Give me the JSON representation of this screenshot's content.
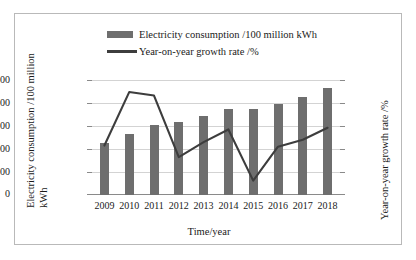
{
  "chart_data": {
    "type": "bar",
    "title": "",
    "categories": [
      "2009",
      "2010",
      "2011",
      "2012",
      "2013",
      "2014",
      "2015",
      "2016",
      "2017",
      "2018"
    ],
    "series": [
      {
        "name": "Electricity consumption /100 million kWh",
        "type": "bar",
        "axis": "left",
        "color": "#6e6e6e",
        "values": [
          1130,
          1320,
          1520,
          1590,
          1710,
          1870,
          1870,
          1980,
          2140,
          2330
        ]
      },
      {
        "name": "Year-on-year growth rate /%",
        "type": "line",
        "axis": "right",
        "color": "#3d3d3d",
        "values": [
          6.6,
          15.9,
          15.3,
          4.6,
          7.2,
          9.4,
          0.5,
          6.4,
          7.6,
          9.7
        ]
      }
    ],
    "xlabel": "Time/year",
    "ylabel": "Electricity consumption /100 million kWh",
    "ylabel_line1": "Electricity consumption /100 million",
    "ylabel_line2": "kWh",
    "y2label": "Year-on-year growth rate /%",
    "ylim": [
      0,
      2500
    ],
    "y2lim": [
      -2,
      18
    ],
    "yticks": [
      "0",
      "500",
      "1000",
      "1500",
      "2000",
      "2500"
    ],
    "ytick_values": [
      0,
      500,
      1000,
      1500,
      2000,
      2500
    ],
    "y2ticks": [
      "-2",
      "0",
      "2",
      "4",
      "6",
      "8",
      "10",
      "12",
      "14",
      "16",
      "18"
    ],
    "y2tick_values": [
      -2,
      0,
      2,
      4,
      6,
      8,
      10,
      12,
      14,
      16,
      18
    ],
    "grid": true,
    "legend_position": "top"
  },
  "legend": {
    "items": [
      {
        "label": "Electricity consumption /100 million kWh",
        "marker": "bar-swatch"
      },
      {
        "label": "Year-on-year growth rate /%",
        "marker": "line-swatch"
      }
    ]
  },
  "axes": {
    "x_title": "Time/year",
    "y_left_title_line1": "Electricity consumption /100 million",
    "y_left_title_line2": "kWh",
    "y_right_title": "Year-on-year growth rate /%"
  }
}
